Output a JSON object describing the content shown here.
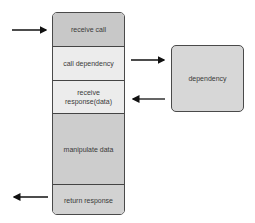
{
  "diagram": {
    "stack": {
      "segments": [
        {
          "label": "receive call",
          "color": "#c8c8c8"
        },
        {
          "label": "call dependency",
          "color": "#ececec"
        },
        {
          "label": "receive response(data)",
          "color": "#ececec"
        },
        {
          "label": "manipulate data",
          "color": "#cdcdcd"
        },
        {
          "label": "return response",
          "color": "#d2d2d2"
        }
      ]
    },
    "dependency": {
      "label": "dependency",
      "color": "#d7d7d7"
    },
    "arrows": [
      {
        "from": "outside-left",
        "to": "receive call",
        "direction": "right"
      },
      {
        "from": "call dependency",
        "to": "dependency",
        "direction": "right"
      },
      {
        "from": "dependency",
        "to": "receive response(data)",
        "direction": "left"
      },
      {
        "from": "return response",
        "to": "outside-left",
        "direction": "left"
      }
    ]
  }
}
